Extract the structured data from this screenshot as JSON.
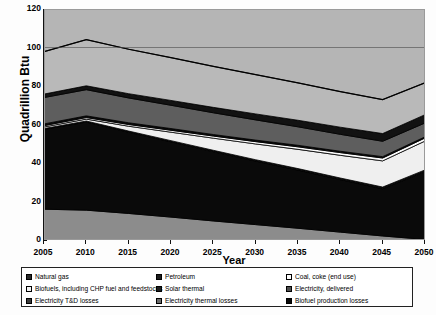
{
  "chart_data": {
    "type": "area",
    "title": "",
    "xlabel": "Year",
    "ylabel": "Quadrillion Btu",
    "xlim": [
      2005,
      2050
    ],
    "ylim": [
      0,
      120
    ],
    "ytick_labels": [
      "0",
      "20",
      "40",
      "60",
      "80",
      "100",
      "120"
    ],
    "ytick_values": [
      0,
      20,
      40,
      60,
      80,
      100,
      120
    ],
    "xtick_labels": [
      "2005",
      "2010",
      "2015",
      "2020",
      "2025",
      "2030",
      "2035",
      "2040",
      "2045",
      "2050"
    ],
    "x": [
      2005,
      2010,
      2015,
      2020,
      2025,
      2030,
      2035,
      2040,
      2045,
      2050
    ],
    "stacked": true,
    "grid": false,
    "legend_position": "bottom",
    "series": [
      {
        "name": "Electricity, delivered",
        "color": "#8c8c8c",
        "values": [
          16.0,
          15.5,
          13.8,
          11.9,
          9.9,
          8.0,
          6.1,
          4.1,
          2.1,
          0.3
        ]
      },
      {
        "name": "Natural gas",
        "color": "#0a0a0a",
        "values": [
          41.5,
          45.8,
          42.2,
          39.1,
          36.0,
          33.0,
          30.2,
          27.3,
          24.5,
          35.2
        ]
      },
      {
        "name": "Biofuel production losses",
        "color": "#111111",
        "values": [
          0.4,
          0.5,
          0.6,
          0.6,
          0.7,
          0.7,
          0.8,
          0.8,
          0.9,
          0.9
        ]
      },
      {
        "name": "Biofuels, including CHP fuel and feedstocks",
        "color": "#efefef",
        "values": [
          0.8,
          1.0,
          2.5,
          4.4,
          6.3,
          8.2,
          10.0,
          11.8,
          13.6,
          15.0
        ]
      },
      {
        "name": "Solar thermal",
        "color": "#fdfdfd",
        "values": [
          0.7,
          0.8,
          0.9,
          1.0,
          1.1,
          1.2,
          1.3,
          1.4,
          1.5,
          1.6
        ]
      },
      {
        "name": "Coal, coke (end use)",
        "color": "#0d0d0d",
        "values": [
          0.9,
          0.9,
          0.9,
          0.9,
          0.8,
          0.8,
          0.8,
          0.7,
          0.7,
          0.6
        ]
      },
      {
        "name": "Petroleum",
        "color": "#5e5e5e",
        "values": [
          13.7,
          13.6,
          12.9,
          12.1,
          11.3,
          10.5,
          9.6,
          8.8,
          8.0,
          7.2
        ]
      },
      {
        "name": "Electricity thermal losses",
        "color": "#121212",
        "values": [
          1.8,
          2.0,
          2.2,
          2.5,
          2.8,
          3.1,
          3.4,
          3.7,
          4.0,
          4.3
        ]
      },
      {
        "name": "Electricity T&D losses",
        "color": "#b9b9b9",
        "values": [
          22.0,
          24.0,
          23.1,
          22.2,
          21.3,
          20.4,
          19.4,
          18.5,
          17.6,
          16.6
        ]
      }
    ],
    "totals": [
      97.8,
      104.1,
      99.1,
      94.7,
      90.2,
      85.9,
      81.6,
      77.1,
      72.9,
      81.7
    ]
  },
  "axes": {
    "y_title": "Quadrillion Btu",
    "x_title": "Year"
  },
  "legend": {
    "columns": [
      {
        "items": [
          {
            "label": "Natural gas",
            "swatch": "dark-pattern"
          },
          {
            "label": "Biofuels, including CHP fuel and feedstocks",
            "swatch": "light-pattern"
          },
          {
            "label": "Electricity T&D losses",
            "swatch": "mid-pattern"
          }
        ]
      },
      {
        "items": [
          {
            "label": "Petroleum",
            "swatch": "dark-solid"
          },
          {
            "label": "Solar thermal",
            "swatch": "dark-solid"
          },
          {
            "label": "Electricity thermal losses",
            "swatch": "hatch-pattern"
          }
        ]
      },
      {
        "items": [
          {
            "label": "Coal, coke (end use)",
            "swatch": "white-pattern"
          },
          {
            "label": "Electricity, delivered",
            "swatch": "grey-pattern"
          },
          {
            "label": "Biofuel production losses",
            "swatch": "black-solid"
          }
        ]
      }
    ]
  }
}
